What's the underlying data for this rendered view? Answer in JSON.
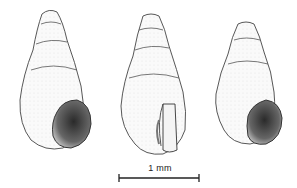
{
  "figure": {
    "specimens": [
      {
        "name": "shell-left",
        "view": "apertural",
        "aperture": "visible"
      },
      {
        "name": "shell-middle",
        "view": "apertural",
        "aperture": "cut-away lip"
      },
      {
        "name": "shell-right",
        "view": "apertural",
        "aperture": "visible"
      }
    ],
    "scale_bar": {
      "label": "1 mm"
    },
    "colors": {
      "ink": "#333333",
      "shade": "#555555",
      "background": "#ffffff"
    }
  }
}
